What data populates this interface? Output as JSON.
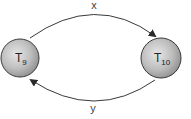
{
  "diagram": {
    "type": "state-transition",
    "nodes": [
      {
        "id": "T9",
        "label": "T",
        "subscript": "9",
        "cx": 20,
        "cy": 58,
        "r": 19
      },
      {
        "id": "T10",
        "label": "T",
        "subscript": "10",
        "cx": 161,
        "cy": 58,
        "r": 20
      }
    ],
    "edges": [
      {
        "from": "T9",
        "to": "T10",
        "label": "x",
        "position": "top"
      },
      {
        "from": "T10",
        "to": "T9",
        "label": "y",
        "position": "bottom"
      }
    ],
    "colors": {
      "node_fill_light": "#e8e8e8",
      "node_fill_dark": "#9a9a9a",
      "node_stroke": "#3a3a3a",
      "edge_stroke": "#3a3a3a"
    }
  }
}
